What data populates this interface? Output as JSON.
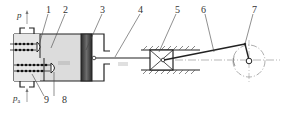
{
  "diagram": {
    "type": "reciprocating-compressor-mechanism",
    "labels": [
      {
        "id": "1",
        "text": "1"
      },
      {
        "id": "2",
        "text": "2"
      },
      {
        "id": "3",
        "text": "3"
      },
      {
        "id": "4",
        "text": "4"
      },
      {
        "id": "5",
        "text": "5"
      },
      {
        "id": "6",
        "text": "6"
      },
      {
        "id": "7",
        "text": "7"
      },
      {
        "id": "8",
        "text": "8"
      },
      {
        "id": "9",
        "text": "9"
      }
    ],
    "pressure_out": {
      "symbol": "p"
    },
    "pressure_in": {
      "symbol": "p",
      "subscript": "a"
    },
    "colors": {
      "line": "#222222",
      "chamber_fill": "#d9d9d9",
      "piston_dark": "#2a2a2a",
      "piston_light": "#8a8a8a",
      "centerline": "#888888"
    }
  }
}
